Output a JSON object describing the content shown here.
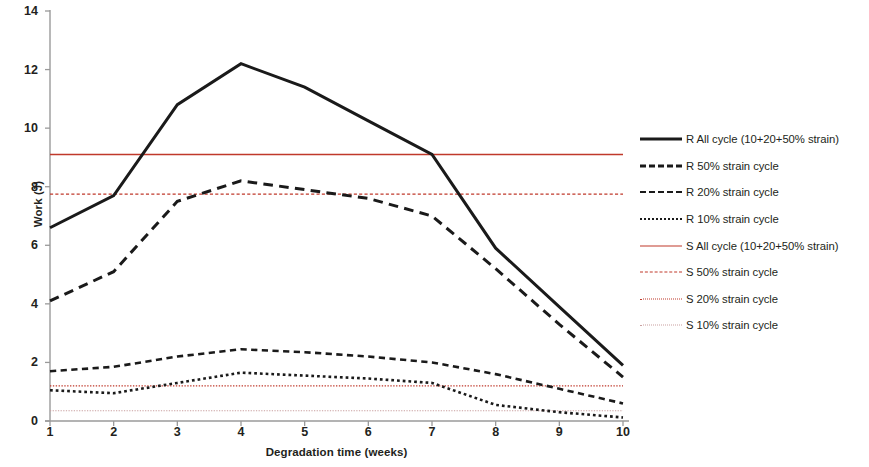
{
  "chart_data": {
    "type": "line",
    "title": "",
    "xlabel": "Degradation time (weeks)",
    "ylabel": "Work (J)",
    "x": [
      1,
      2,
      3,
      4,
      5,
      6,
      7,
      8,
      9,
      10
    ],
    "xticklabels": [
      "1",
      "2",
      "3",
      "4",
      "5",
      "6",
      "7",
      "8",
      "9",
      "10"
    ],
    "yticklabels": [
      "0",
      "2",
      "4",
      "6",
      "8",
      "10",
      "12",
      "14"
    ],
    "xlim": [
      1,
      10
    ],
    "ylim": [
      0,
      14
    ],
    "ytick_step": 2,
    "grid": false,
    "legend_position": "right",
    "series": [
      {
        "name": "R All cycle (10+20+50% strain)",
        "color": "#1a1a1a",
        "style": "solid",
        "width": 3.0,
        "values": [
          6.6,
          7.7,
          10.8,
          12.2,
          11.4,
          10.25,
          9.1,
          5.9,
          3.9,
          1.9
        ]
      },
      {
        "name": "R 50% strain  cycle",
        "color": "#1a1a1a",
        "style": "dashed-long",
        "width": 3.0,
        "values": [
          4.1,
          5.1,
          7.5,
          8.2,
          7.9,
          7.6,
          7.0,
          5.2,
          3.3,
          1.5
        ]
      },
      {
        "name": "R 20% strain  cycle",
        "color": "#1a1a1a",
        "style": "dashed-short",
        "width": 2.6,
        "values": [
          1.7,
          1.85,
          2.2,
          2.45,
          2.35,
          2.2,
          2.0,
          1.6,
          1.1,
          0.6
        ]
      },
      {
        "name": "R 10% strain  cycle",
        "color": "#1a1a1a",
        "style": "dotted",
        "width": 2.6,
        "values": [
          1.05,
          0.95,
          1.3,
          1.65,
          1.55,
          1.45,
          1.3,
          0.55,
          0.3,
          0.12
        ]
      },
      {
        "name": "S All cycle (10+20+50% strain)",
        "color": "#c0392b",
        "style": "solid",
        "width": 1.3,
        "constant": 9.1,
        "values": [
          9.1,
          9.1,
          9.1,
          9.1,
          9.1,
          9.1,
          9.1,
          9.1,
          9.1,
          9.1
        ]
      },
      {
        "name": "S 50% strain  cycle",
        "color": "#c0392b",
        "style": "dashed-short",
        "width": 1.3,
        "constant": 7.75,
        "values": [
          7.75,
          7.75,
          7.75,
          7.75,
          7.75,
          7.75,
          7.75,
          7.75,
          7.75,
          7.75
        ]
      },
      {
        "name": "S 20% strain  cycle",
        "color": "#c0392b",
        "style": "dotted",
        "width": 1.3,
        "constant": 1.2,
        "values": [
          1.2,
          1.2,
          1.2,
          1.2,
          1.2,
          1.2,
          1.2,
          1.2,
          1.2,
          1.2
        ]
      },
      {
        "name": "S 10% strain  cycle",
        "color": "#c9a0a0",
        "style": "dotted",
        "width": 1.2,
        "constant": 0.35,
        "values": [
          0.35,
          0.35,
          0.35,
          0.35,
          0.35,
          0.35,
          0.35,
          0.35,
          0.35,
          0.35
        ]
      }
    ]
  },
  "axes": {
    "y_title": "Work (J)",
    "x_title": "Degradation time (weeks)"
  },
  "legend": {
    "items": [
      {
        "label": "R All cycle (10+20+50% strain)"
      },
      {
        "label": "R 50% strain  cycle"
      },
      {
        "label": "R 20% strain  cycle"
      },
      {
        "label": "R 10% strain  cycle"
      },
      {
        "label": "S All cycle (10+20+50% strain)"
      },
      {
        "label": "S 50% strain  cycle"
      },
      {
        "label": "S 20% strain  cycle"
      },
      {
        "label": "S 10% strain  cycle"
      }
    ]
  }
}
